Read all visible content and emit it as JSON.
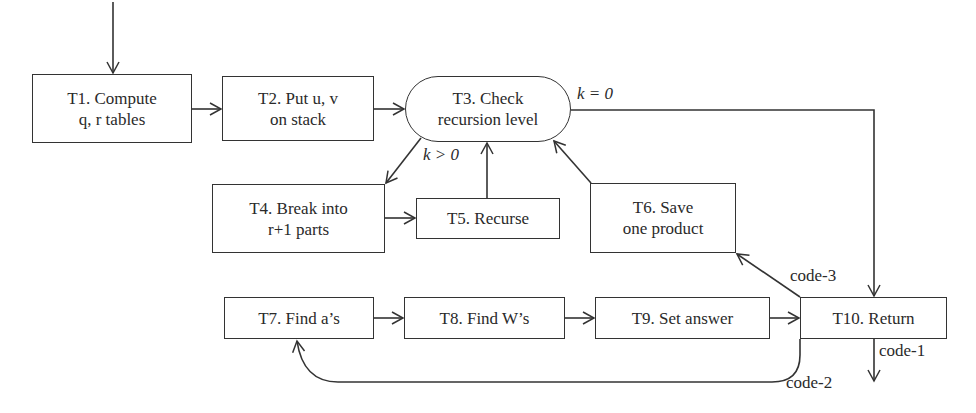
{
  "diagram": {
    "type": "flowchart",
    "nodes": [
      {
        "id": "T1",
        "line1": "T1. Compute",
        "line2": "q, r tables"
      },
      {
        "id": "T2",
        "line1": "T2. Put u, v",
        "line2": "on stack"
      },
      {
        "id": "T3",
        "line1": "T3. Check",
        "line2": "recursion level",
        "shape": "stadium"
      },
      {
        "id": "T4",
        "line1": "T4. Break into",
        "line2": "r+1 parts"
      },
      {
        "id": "T5",
        "line1": "T5. Recurse"
      },
      {
        "id": "T6",
        "line1": "T6. Save",
        "line2": "one product"
      },
      {
        "id": "T7",
        "line1": "T7. Find a’s"
      },
      {
        "id": "T8",
        "line1": "T8. Find W’s"
      },
      {
        "id": "T9",
        "line1": "T9. Set answer"
      },
      {
        "id": "T10",
        "line1": "T10. Return"
      }
    ],
    "edge_labels": {
      "k_eq_0": "k = 0",
      "k_gt_0": "k > 0",
      "code_1": "code-1",
      "code_2": "code-2",
      "code_3": "code-3"
    },
    "edges": [
      {
        "from": "entry",
        "to": "T1"
      },
      {
        "from": "T1",
        "to": "T2"
      },
      {
        "from": "T2",
        "to": "T3"
      },
      {
        "from": "T3",
        "to": "T10",
        "label": "k = 0"
      },
      {
        "from": "T3",
        "to": "T4",
        "label": "k > 0"
      },
      {
        "from": "T4",
        "to": "T5"
      },
      {
        "from": "T5",
        "to": "T3"
      },
      {
        "from": "T6",
        "to": "T3"
      },
      {
        "from": "T10",
        "to": "T6",
        "label": "code-3"
      },
      {
        "from": "T7",
        "to": "T8"
      },
      {
        "from": "T8",
        "to": "T9"
      },
      {
        "from": "T9",
        "to": "T10"
      },
      {
        "from": "T10",
        "to": "T7",
        "label": "code-2"
      },
      {
        "from": "T10",
        "to": "exit",
        "label": "code-1"
      }
    ],
    "colors": {
      "stroke": "#333333",
      "background": "#ffffff",
      "text": "#2a2a2a"
    }
  }
}
